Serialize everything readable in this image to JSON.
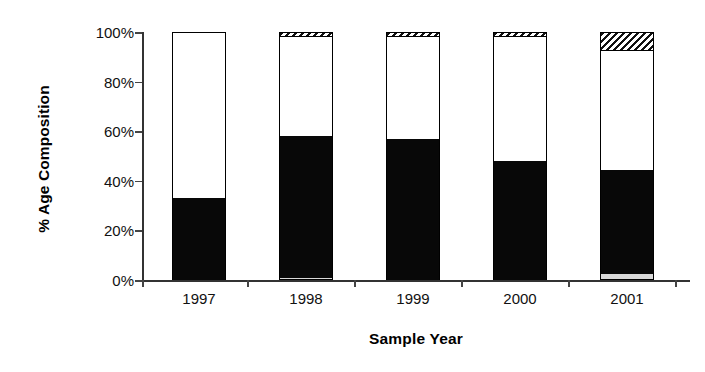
{
  "chart_data": {
    "type": "bar",
    "title": "",
    "xlabel": "Sample Year",
    "ylabel": "% Age Composition",
    "categories": [
      "1997",
      "1998",
      "1999",
      "2000",
      "2001"
    ],
    "ylim": [
      0,
      100
    ],
    "ytick_labels": [
      "0%",
      "20%",
      "40%",
      "60%",
      "80%",
      "100%"
    ],
    "ytick_values": [
      0,
      20,
      40,
      60,
      80,
      100
    ],
    "grid": false,
    "legend": "none",
    "stacked": true,
    "series": [
      {
        "name": "age-class-1",
        "pattern": "light-gray",
        "values": [
          0,
          1,
          0,
          0,
          2.5
        ]
      },
      {
        "name": "age-class-2",
        "pattern": "solid-black",
        "values": [
          33,
          57,
          57,
          48,
          42
        ]
      },
      {
        "name": "age-class-3",
        "pattern": "white",
        "values": [
          67,
          40,
          41,
          50,
          48
        ]
      },
      {
        "name": "age-class-4",
        "pattern": "diagonal-hatch",
        "values": [
          0,
          2,
          2,
          2,
          7.5
        ]
      }
    ]
  },
  "axes": {
    "y_title": "% Age Composition",
    "x_title": "Sample Year"
  }
}
